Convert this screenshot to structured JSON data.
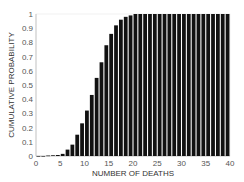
{
  "chart_data": {
    "type": "bar",
    "title": "",
    "xlabel": "NUMBER OF DEATHS",
    "ylabel": "CUMULATIVE PROBABILITY",
    "xlim": [
      0,
      40
    ],
    "ylim": [
      0,
      1
    ],
    "grid": false,
    "legend": null,
    "xticks": [
      0,
      5,
      10,
      15,
      20,
      25,
      30,
      35,
      40
    ],
    "yticks": [
      0,
      0.1,
      0.2,
      0.3,
      0.4,
      0.5,
      0.6,
      0.7,
      0.8,
      0.9,
      1
    ],
    "bar_color": "#111111",
    "categories": [
      0,
      1,
      2,
      3,
      4,
      5,
      6,
      7,
      8,
      9,
      10,
      11,
      12,
      13,
      14,
      15,
      16,
      17,
      18,
      19,
      20,
      21,
      22,
      23,
      24,
      25,
      26,
      27,
      28,
      29,
      30,
      31,
      32,
      33,
      34,
      35,
      36,
      37,
      38,
      39
    ],
    "values": [
      0.0,
      0.0,
      0.003,
      0.005,
      0.007,
      0.015,
      0.045,
      0.08,
      0.15,
      0.23,
      0.32,
      0.43,
      0.55,
      0.66,
      0.78,
      0.86,
      0.92,
      0.96,
      0.98,
      0.99,
      1.0,
      1.0,
      1.0,
      1.0,
      1.0,
      1.0,
      1.0,
      1.0,
      1.0,
      1.0,
      1.0,
      1.0,
      1.0,
      1.0,
      1.0,
      1.0,
      1.0,
      1.0,
      1.0,
      1.0
    ]
  }
}
